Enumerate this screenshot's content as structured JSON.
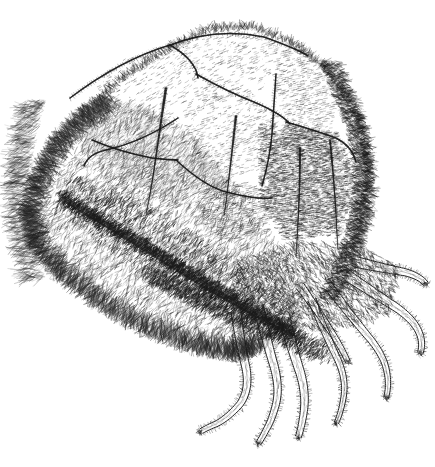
{
  "image": {
    "domain": "Natural-Image",
    "medium": "pen-and-ink engraving",
    "subject": "fur cap made of animal pelts with dangling tails",
    "background_color": "#ffffff",
    "ink_color": "#1a1a1a",
    "width": 435,
    "height": 467,
    "has_caption": false,
    "caption_text": "",
    "has_border": false
  },
  "palette": {
    "paper": "#ffffff",
    "ink": "#1a1a1a",
    "ink_mid": "#3a3a3a",
    "ink_light": "#6a6a6a",
    "shadow": "#101010"
  },
  "composition": {
    "object_bbox": {
      "x": 8,
      "y": 18,
      "width": 410,
      "height": 432
    },
    "lighting": "light from upper-left, deep shadow on lower-right",
    "orientation": "three-quarter view from above-left"
  },
  "parts": [
    {
      "name": "crown",
      "label": "segmented pelt crown",
      "description": "dome of stitched fur panels with hatched shading",
      "bbox": {
        "x": 60,
        "y": 18,
        "width": 300,
        "height": 200
      }
    },
    {
      "name": "brim",
      "label": "shaggy fur brim",
      "description": "long radiating hair strokes forming the flared brim",
      "bbox": {
        "x": 8,
        "y": 70,
        "width": 330,
        "height": 290
      }
    },
    {
      "name": "dark-band",
      "label": "dark fur band",
      "description": "dense crosshatched shadow band across the lower brim",
      "bbox": {
        "x": 60,
        "y": 200,
        "width": 300,
        "height": 140
      }
    },
    {
      "name": "tails",
      "label": "dangling animal tails and paws",
      "description": "eight slender furred tails hanging from the rear right",
      "bbox": {
        "x": 205,
        "y": 300,
        "width": 210,
        "height": 150
      }
    },
    {
      "name": "seam-tassels",
      "label": "small pointed tassels on crown seams",
      "description": "three narrow dark tapered tails on the crown panels",
      "bbox": {
        "x": 140,
        "y": 85,
        "width": 180,
        "height": 130
      }
    }
  ],
  "panels": [
    {
      "id": 1,
      "label": "left crown panel"
    },
    {
      "id": 2,
      "label": "upper center panel"
    },
    {
      "id": 3,
      "label": "center panel"
    },
    {
      "id": 4,
      "label": "right crown panel"
    },
    {
      "id": 5,
      "label": "rear shadow panel"
    },
    {
      "id": 6,
      "label": "lower left panel"
    }
  ]
}
